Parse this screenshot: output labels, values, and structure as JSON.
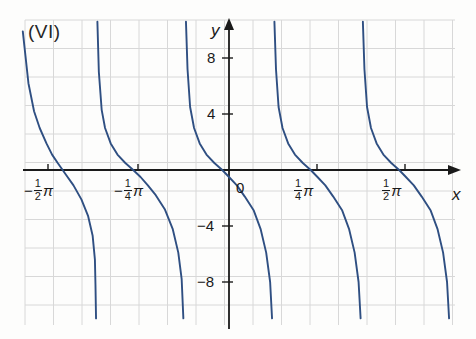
{
  "figure": {
    "panel_label": "(VI)",
    "axis_x_name": "x",
    "axis_y_name": "y"
  },
  "colors": {
    "curve": "#2f4f82",
    "axis": "#1a1a1a",
    "grid": "#d8d8d8",
    "text": "#1a1a1a",
    "background": "#fdfdfc"
  },
  "x_ticks": [
    {
      "id": "neg-half-pi",
      "label": "-1/2π",
      "sign": "−",
      "num": "1",
      "den": "2",
      "pi": "π",
      "value": -1.5707963,
      "px": 48
    },
    {
      "id": "neg-quarter-pi",
      "label": "-1/4π",
      "sign": "−",
      "num": "1",
      "den": "4",
      "pi": "π",
      "value": -0.7853982,
      "px": 138
    },
    {
      "id": "zero",
      "label": "0",
      "sign": "",
      "num": "",
      "den": "",
      "pi": "",
      "value": 0,
      "px": 229
    },
    {
      "id": "quarter-pi",
      "label": "1/4π",
      "sign": "",
      "num": "1",
      "den": "4",
      "pi": "π",
      "value": 0.7853982,
      "px": 317
    },
    {
      "id": "half-pi",
      "label": "1/2π",
      "sign": "",
      "num": "1",
      "den": "2",
      "pi": "π",
      "value": 1.5707963,
      "px": 405
    }
  ],
  "y_ticks": [
    {
      "label": "8",
      "value": 8,
      "px": 58
    },
    {
      "label": "4",
      "value": 4,
      "px": 114
    },
    {
      "label": "0",
      "value": 0,
      "px": 170
    },
    {
      "label": "−4",
      "value": -4,
      "px": 226
    },
    {
      "label": "−8",
      "value": -8,
      "px": 282
    }
  ],
  "chart_data": {
    "type": "line",
    "title": "(VI)",
    "xlabel": "x",
    "ylabel": "y",
    "xlim": [
      -1.83,
      1.97
    ],
    "ylim": [
      -11.0,
      10.7
    ],
    "grid": true,
    "legend": null,
    "function": "y = cot(2x + pi/4)",
    "period": 1.5707963,
    "asymptotes": [
      -1.9634954,
      -1.1780972,
      -0.3926991,
      0.3926991,
      1.1780972,
      1.9634954
    ],
    "zero_crossings": [
      -1.5707963,
      -0.7853982,
      0.0,
      0.7853982,
      1.5707963
    ],
    "zero_crossing_offset_px": -14,
    "branches": [
      {
        "name": "branch-1",
        "asymptote_left": -1.9634954,
        "asymptote_right": -1.1780972,
        "points": [
          [
            -1.83,
            9.9
          ],
          [
            -1.78,
            6.2
          ],
          [
            -1.73,
            4.2
          ],
          [
            -1.68,
            3.0
          ],
          [
            -1.62,
            1.9
          ],
          [
            -1.57,
            1.1
          ],
          [
            -1.52,
            0.5
          ],
          [
            -1.45,
            -0.3
          ],
          [
            -1.38,
            -1.1
          ],
          [
            -1.31,
            -2.1
          ],
          [
            -1.25,
            -3.3
          ],
          [
            -1.21,
            -4.7
          ],
          [
            -1.19,
            -6.4
          ],
          [
            -1.185,
            -8.2
          ],
          [
            -1.18,
            -10.6
          ]
        ]
      },
      {
        "name": "branch-2",
        "asymptote_left": -1.1780972,
        "asymptote_right": -0.3926991,
        "points": [
          [
            -1.168,
            10.6
          ],
          [
            -1.155,
            7.0
          ],
          [
            -1.13,
            4.3
          ],
          [
            -1.1,
            3.0
          ],
          [
            -1.05,
            1.9
          ],
          [
            -0.99,
            1.1
          ],
          [
            -0.92,
            0.5
          ],
          [
            -0.85,
            0.0
          ],
          [
            -0.785,
            -0.5
          ],
          [
            -0.72,
            -1.1
          ],
          [
            -0.65,
            -1.8
          ],
          [
            -0.57,
            -2.8
          ],
          [
            -0.5,
            -4.2
          ],
          [
            -0.45,
            -5.9
          ],
          [
            -0.42,
            -7.8
          ],
          [
            -0.405,
            -10.6
          ]
        ]
      },
      {
        "name": "branch-3",
        "asymptote_left": -0.3926991,
        "asymptote_right": 0.3926991,
        "points": [
          [
            -0.382,
            10.6
          ],
          [
            -0.368,
            7.2
          ],
          [
            -0.345,
            4.5
          ],
          [
            -0.31,
            3.0
          ],
          [
            -0.26,
            1.9
          ],
          [
            -0.2,
            1.1
          ],
          [
            -0.13,
            0.5
          ],
          [
            -0.06,
            0.0
          ],
          [
            0.0,
            -0.5
          ],
          [
            0.07,
            -1.1
          ],
          [
            0.14,
            -1.9
          ],
          [
            0.22,
            -2.9
          ],
          [
            0.28,
            -4.2
          ],
          [
            0.33,
            -5.9
          ],
          [
            0.365,
            -8.0
          ],
          [
            0.382,
            -10.6
          ]
        ]
      },
      {
        "name": "branch-4",
        "asymptote_left": 0.3926991,
        "asymptote_right": 1.1780972,
        "points": [
          [
            0.403,
            10.6
          ],
          [
            0.417,
            7.2
          ],
          [
            0.44,
            4.5
          ],
          [
            0.475,
            3.0
          ],
          [
            0.525,
            1.9
          ],
          [
            0.585,
            1.1
          ],
          [
            0.655,
            0.5
          ],
          [
            0.725,
            0.0
          ],
          [
            0.785,
            -0.5
          ],
          [
            0.855,
            -1.1
          ],
          [
            0.925,
            -1.9
          ],
          [
            1.005,
            -2.9
          ],
          [
            1.065,
            -4.2
          ],
          [
            1.115,
            -5.9
          ],
          [
            1.15,
            -8.0
          ],
          [
            1.168,
            -10.6
          ]
        ]
      },
      {
        "name": "branch-5",
        "asymptote_left": 1.1780972,
        "asymptote_right": 1.9634954,
        "points": [
          [
            1.188,
            10.6
          ],
          [
            1.202,
            7.2
          ],
          [
            1.225,
            4.5
          ],
          [
            1.26,
            3.0
          ],
          [
            1.31,
            1.9
          ],
          [
            1.37,
            1.1
          ],
          [
            1.44,
            0.5
          ],
          [
            1.51,
            0.0
          ],
          [
            1.57,
            -0.5
          ],
          [
            1.64,
            -1.1
          ],
          [
            1.71,
            -1.9
          ],
          [
            1.79,
            -2.9
          ],
          [
            1.85,
            -4.2
          ],
          [
            1.9,
            -5.9
          ],
          [
            1.935,
            -8.0
          ],
          [
            1.953,
            -10.6
          ]
        ]
      }
    ]
  },
  "grid_geometry": {
    "left_px": 25,
    "right_px": 455,
    "top_px": 20,
    "bottom_px": 325,
    "cell_px": 28.5,
    "origin_x_px": 229,
    "origin_y_px": 170,
    "px_per_unit_y": 14.0,
    "px_per_pi_quarter": 88.5
  }
}
